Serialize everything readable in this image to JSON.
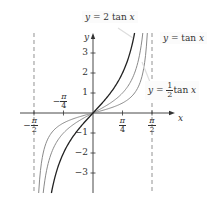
{
  "chart_data": {
    "type": "line",
    "title": "",
    "xlabel": "x",
    "ylabel": "y",
    "xlim": [
      -1.5708,
      1.5708
    ],
    "ylim": [
      -4,
      4
    ],
    "grid": false,
    "x_ticks": [
      {
        "value": -1.5708,
        "num": "π",
        "den": "2",
        "sign": "−"
      },
      {
        "value": -0.7854,
        "num": "π",
        "den": "4",
        "sign": "−"
      },
      {
        "value": 0.7854,
        "num": "π",
        "den": "4",
        "sign": ""
      },
      {
        "value": 1.5708,
        "num": "π",
        "den": "2",
        "sign": ""
      }
    ],
    "y_ticks": [
      -3,
      -2,
      -1,
      1,
      2,
      3
    ],
    "y_tick_labels": [
      "−3",
      "−2",
      "−1",
      "1",
      "2",
      "3"
    ],
    "asymptotes": [
      -1.5708,
      1.5708
    ],
    "series": [
      {
        "name": "y = 2 tan x",
        "k": 2,
        "color": "#222222"
      },
      {
        "name": "y = tan x",
        "k": 1,
        "color": "#8a8a8a"
      },
      {
        "name": "y = ½ tan x",
        "k": 0.5,
        "color": "#8a8a8a"
      }
    ],
    "annotations": {
      "two_tan": {
        "y": "y",
        "eq": " = 2 tan ",
        "x": "x"
      },
      "tan": {
        "y": "y",
        "eq": " = tan ",
        "x": "x"
      },
      "half_tan": {
        "y": "y",
        "eq": " = ",
        "num": "1",
        "den": "2",
        "tail": "tan ",
        "x": "x"
      }
    }
  }
}
